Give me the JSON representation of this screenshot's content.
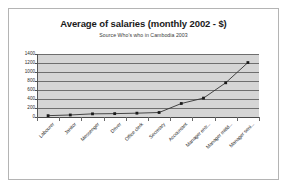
{
  "chart_data": {
    "type": "line",
    "title": "Average of salaries (monthly 2002 - $)",
    "subtitle": "Source Who's who in Cambodia 2003",
    "xlabel": "",
    "ylabel": "",
    "ylim": [
      0,
      1400
    ],
    "ytick_step": 200,
    "yticks": [
      "0",
      "200",
      "400",
      "600",
      "800",
      "1000",
      "1200",
      "1400"
    ],
    "grid": true,
    "legend": "none",
    "marker": "square-dot",
    "categories": [
      "Labourer",
      "Janitor",
      "Messenger",
      "Driver",
      "Office clerk",
      "Secretary",
      "Accountant",
      "Manager entr...",
      "Manager midd...",
      "Manager seni..."
    ],
    "values": [
      30,
      45,
      70,
      75,
      85,
      100,
      300,
      420,
      760,
      1210
    ],
    "series_name": "Average of salaries"
  },
  "colors": {
    "plot_background": "#d5d5d5",
    "gridline": "#6e6e6e",
    "line": "#333333",
    "marker": "#1a1a1a",
    "frame_border": "#b4b4b4",
    "title_text": "#1a1a1a"
  }
}
